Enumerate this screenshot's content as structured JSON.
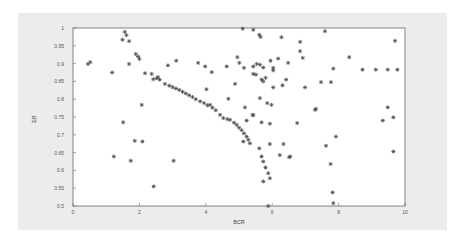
{
  "chart_data": {
    "type": "scatter",
    "title": "",
    "xlabel": "BCR",
    "ylabel": "EB",
    "xlim": [
      0,
      10
    ],
    "ylim": [
      0.5,
      1
    ],
    "x_ticks": [
      "0",
      "2",
      "4",
      "6",
      "8",
      "10"
    ],
    "y_ticks": [
      "0.5",
      "0.55",
      "0.6",
      "0.65",
      "0.7",
      "0.75",
      "0.8",
      "0.85",
      "0.9",
      "0.95",
      "1"
    ],
    "grid": false,
    "legend": null,
    "marker": "asterisk",
    "series": [
      {
        "name": "points",
        "points": [
          [
            1.56,
            0.989
          ],
          [
            1.61,
            0.98
          ],
          [
            1.49,
            0.967
          ],
          [
            1.69,
            0.963
          ],
          [
            1.89,
            0.927
          ],
          [
            1.96,
            0.92
          ],
          [
            2.0,
            0.913
          ],
          [
            0.45,
            0.899
          ],
          [
            0.52,
            0.904
          ],
          [
            1.69,
            0.899
          ],
          [
            1.18,
            0.875
          ],
          [
            2.17,
            0.873
          ],
          [
            2.37,
            0.871
          ],
          [
            2.42,
            0.856
          ],
          [
            2.52,
            0.859
          ],
          [
            2.56,
            0.862
          ],
          [
            2.61,
            0.855
          ],
          [
            2.07,
            0.784
          ],
          [
            2.86,
            0.895
          ],
          [
            3.11,
            0.908
          ],
          [
            3.77,
            0.902
          ],
          [
            3.98,
            0.892
          ],
          [
            4.18,
            0.876
          ],
          [
            4.63,
            0.892
          ],
          [
            4.95,
            0.918
          ],
          [
            5.01,
            0.902
          ],
          [
            5.15,
            0.888
          ],
          [
            4.88,
            0.843
          ],
          [
            4.02,
            0.828
          ],
          [
            4.68,
            0.801
          ],
          [
            5.18,
            0.777
          ],
          [
            4.13,
            0.784
          ],
          [
            5.11,
            0.998
          ],
          [
            5.43,
            0.995
          ],
          [
            5.61,
            0.981
          ],
          [
            5.65,
            0.975
          ],
          [
            6.28,
            0.974
          ],
          [
            7.59,
            0.991
          ],
          [
            6.84,
            0.961
          ],
          [
            6.84,
            0.935
          ],
          [
            6.92,
            0.916
          ],
          [
            8.32,
            0.918
          ],
          [
            9.7,
            0.964
          ],
          [
            5.43,
            0.892
          ],
          [
            5.53,
            0.899
          ],
          [
            5.63,
            0.897
          ],
          [
            5.73,
            0.889
          ],
          [
            5.95,
            0.908
          ],
          [
            6.18,
            0.914
          ],
          [
            6.48,
            0.902
          ],
          [
            6.03,
            0.888
          ],
          [
            6.03,
            0.881
          ],
          [
            7.84,
            0.886
          ],
          [
            8.72,
            0.883
          ],
          [
            9.12,
            0.883
          ],
          [
            9.48,
            0.883
          ],
          [
            9.77,
            0.883
          ],
          [
            5.43,
            0.871
          ],
          [
            5.51,
            0.869
          ],
          [
            5.68,
            0.855
          ],
          [
            5.8,
            0.86
          ],
          [
            5.73,
            0.85
          ],
          [
            6.42,
            0.855
          ],
          [
            6.03,
            0.833
          ],
          [
            6.31,
            0.839
          ],
          [
            6.99,
            0.833
          ],
          [
            7.47,
            0.848
          ],
          [
            7.77,
            0.848
          ],
          [
            5.63,
            0.803
          ],
          [
            5.85,
            0.789
          ],
          [
            5.98,
            0.784
          ],
          [
            7.32,
            0.773
          ],
          [
            9.48,
            0.777
          ],
          [
            5.43,
            0.755
          ],
          [
            9.65,
            0.749
          ],
          [
            2.77,
            0.843
          ],
          [
            2.9,
            0.838
          ],
          [
            3.0,
            0.834
          ],
          [
            3.1,
            0.83
          ],
          [
            3.2,
            0.826
          ],
          [
            3.3,
            0.821
          ],
          [
            3.4,
            0.816
          ],
          [
            3.5,
            0.811
          ],
          [
            3.6,
            0.806
          ],
          [
            3.7,
            0.8
          ],
          [
            3.83,
            0.794
          ],
          [
            3.95,
            0.789
          ],
          [
            4.05,
            0.783
          ],
          [
            4.2,
            0.776
          ],
          [
            4.3,
            0.769
          ],
          [
            4.43,
            0.756
          ],
          [
            4.53,
            0.747
          ],
          [
            4.65,
            0.744
          ],
          [
            4.73,
            0.742
          ],
          [
            4.85,
            0.734
          ],
          [
            4.93,
            0.728
          ],
          [
            5.0,
            0.72
          ],
          [
            5.08,
            0.713
          ],
          [
            5.15,
            0.704
          ],
          [
            5.23,
            0.695
          ],
          [
            5.28,
            0.686
          ],
          [
            5.33,
            0.676
          ],
          [
            5.61,
            0.662
          ],
          [
            5.68,
            0.639
          ],
          [
            5.73,
            0.625
          ],
          [
            5.8,
            0.608
          ],
          [
            5.88,
            0.592
          ],
          [
            5.93,
            0.578
          ],
          [
            5.73,
            0.569
          ],
          [
            5.88,
            0.5
          ],
          [
            5.13,
            0.681
          ],
          [
            5.41,
            0.756
          ],
          [
            5.23,
            0.74
          ],
          [
            5.68,
            0.735
          ],
          [
            5.93,
            0.731
          ],
          [
            6.75,
            0.733
          ],
          [
            5.93,
            0.674
          ],
          [
            6.34,
            0.674
          ],
          [
            6.23,
            0.643
          ],
          [
            6.51,
            0.637
          ],
          [
            6.54,
            0.639
          ],
          [
            7.92,
            0.695
          ],
          [
            7.62,
            0.669
          ],
          [
            7.76,
            0.618
          ],
          [
            7.82,
            0.538
          ],
          [
            7.84,
            0.508
          ],
          [
            9.33,
            0.74
          ],
          [
            9.65,
            0.653
          ],
          [
            7.29,
            0.77
          ],
          [
            1.51,
            0.735
          ],
          [
            1.86,
            0.683
          ],
          [
            2.09,
            0.681
          ],
          [
            1.23,
            0.639
          ],
          [
            1.74,
            0.627
          ],
          [
            3.03,
            0.627
          ],
          [
            2.43,
            0.555
          ]
        ]
      }
    ]
  }
}
